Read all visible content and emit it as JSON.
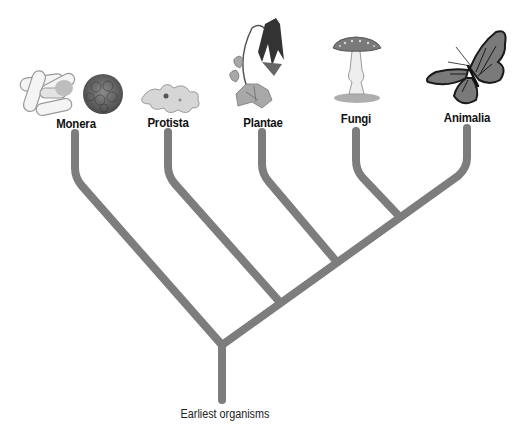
{
  "diagram": {
    "type": "phylogenetic-tree",
    "colors": {
      "branch": "#7d7d7d",
      "label": "#111111",
      "background": "#ffffff"
    },
    "root": {
      "label": "Earliest organisms"
    },
    "kingdoms": [
      {
        "name": "Monera",
        "illustration": "bacteria-cells"
      },
      {
        "name": "Protista",
        "illustration": "amoeba"
      },
      {
        "name": "Plantae",
        "illustration": "columbine-flower"
      },
      {
        "name": "Fungi",
        "illustration": "mushroom"
      },
      {
        "name": "Animalia",
        "illustration": "monarch-butterfly"
      }
    ],
    "branching_order": [
      "Monera",
      "Protista",
      "Plantae",
      [
        "Fungi",
        "Animalia"
      ]
    ]
  }
}
